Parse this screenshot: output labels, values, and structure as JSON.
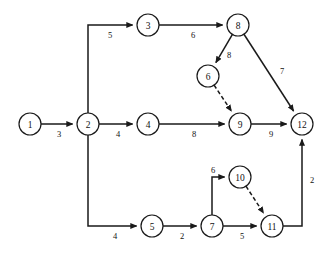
{
  "diagram": {
    "type": "activity-network-diagram",
    "title": "",
    "canvas": {
      "width": 326,
      "height": 254,
      "background": "#ffffff"
    },
    "style": {
      "node_radius": 11,
      "node_fill": "#ffffff",
      "node_stroke": "#1a1a1a",
      "edge_stroke": "#1a1a1a",
      "label_color": "#111111"
    },
    "nodes": [
      {
        "id": "1",
        "label": "1",
        "x": 30,
        "y": 124
      },
      {
        "id": "2",
        "label": "2",
        "x": 88,
        "y": 124
      },
      {
        "id": "3",
        "label": "3",
        "x": 148,
        "y": 25
      },
      {
        "id": "4",
        "label": "4",
        "x": 148,
        "y": 124
      },
      {
        "id": "5",
        "label": "5",
        "x": 152,
        "y": 226
      },
      {
        "id": "6",
        "label": "6",
        "x": 208,
        "y": 76
      },
      {
        "id": "7",
        "label": "7",
        "x": 212,
        "y": 226
      },
      {
        "id": "8",
        "label": "8",
        "x": 238,
        "y": 25
      },
      {
        "id": "9",
        "label": "9",
        "x": 240,
        "y": 124
      },
      {
        "id": "10",
        "label": "10",
        "x": 240,
        "y": 177
      },
      {
        "id": "11",
        "label": "11",
        "x": 272,
        "y": 226
      },
      {
        "id": "12",
        "label": "12",
        "x": 302,
        "y": 124
      }
    ],
    "edges": [
      {
        "id": "e1",
        "from": "1",
        "to": "2",
        "weight": "3",
        "style": "solid",
        "label_x": 59,
        "label_y": 134,
        "shape": "straight"
      },
      {
        "id": "e2",
        "from": "2",
        "to": "3",
        "weight": "5",
        "style": "solid",
        "label_x": 110,
        "label_y": 35,
        "shape": "elbow-up-right"
      },
      {
        "id": "e3",
        "from": "3",
        "to": "8",
        "weight": "6",
        "style": "solid",
        "label_x": 193,
        "label_y": 35,
        "shape": "straight"
      },
      {
        "id": "e4",
        "from": "2",
        "to": "4",
        "weight": "4",
        "style": "solid",
        "label_x": 118,
        "label_y": 134,
        "shape": "straight"
      },
      {
        "id": "e5",
        "from": "4",
        "to": "9",
        "weight": "8",
        "style": "solid",
        "label_x": 194,
        "label_y": 134,
        "shape": "straight"
      },
      {
        "id": "e6",
        "from": "8",
        "to": "6",
        "weight": "8",
        "style": "solid",
        "label_x": 229,
        "label_y": 55,
        "shape": "straight"
      },
      {
        "id": "e7",
        "from": "6",
        "to": "9",
        "weight": "",
        "style": "dashed",
        "label_x": 0,
        "label_y": 0,
        "shape": "straight"
      },
      {
        "id": "e8",
        "from": "8",
        "to": "12",
        "weight": "7",
        "style": "solid",
        "label_x": 282,
        "label_y": 71,
        "shape": "straight"
      },
      {
        "id": "e9",
        "from": "9",
        "to": "12",
        "weight": "9",
        "style": "solid",
        "label_x": 271,
        "label_y": 134,
        "shape": "straight"
      },
      {
        "id": "e10",
        "from": "2",
        "to": "5",
        "weight": "4",
        "style": "solid",
        "label_x": 115,
        "label_y": 236,
        "shape": "elbow-down-right"
      },
      {
        "id": "e11",
        "from": "5",
        "to": "7",
        "weight": "2",
        "style": "solid",
        "label_x": 182,
        "label_y": 236,
        "shape": "straight"
      },
      {
        "id": "e12",
        "from": "7",
        "to": "10",
        "weight": "6",
        "style": "solid",
        "label_x": 213,
        "label_y": 170,
        "shape": "elbow-up-right"
      },
      {
        "id": "e13",
        "from": "10",
        "to": "11",
        "weight": "",
        "style": "dashed",
        "label_x": 0,
        "label_y": 0,
        "shape": "straight"
      },
      {
        "id": "e14",
        "from": "7",
        "to": "11",
        "weight": "5",
        "style": "solid",
        "label_x": 242,
        "label_y": 236,
        "shape": "straight"
      },
      {
        "id": "e15",
        "from": "11",
        "to": "12",
        "weight": "2",
        "style": "solid",
        "label_x": 312,
        "label_y": 180,
        "shape": "elbow-right-up"
      }
    ]
  }
}
